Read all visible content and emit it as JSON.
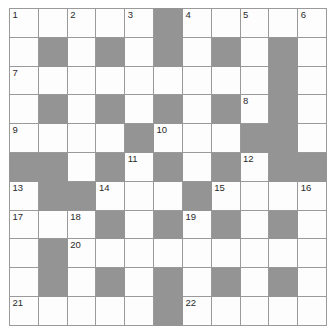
{
  "puzzle": {
    "title": "Crossword Grid",
    "rows": 11,
    "columns": 10,
    "colors": {
      "blocked_cell": "#949494",
      "open_cell": "#fdfdfd",
      "grid_line": "#9a9a9a",
      "number_text": "#2a2a2a"
    },
    "grid": [
      [
        {
          "blocked": false,
          "number": "1"
        },
        {
          "blocked": false,
          "number": ""
        },
        {
          "blocked": false,
          "number": "2"
        },
        {
          "blocked": false,
          "number": ""
        },
        {
          "blocked": false,
          "number": "3"
        },
        {
          "blocked": true,
          "number": ""
        },
        {
          "blocked": false,
          "number": "4"
        },
        {
          "blocked": false,
          "number": ""
        },
        {
          "blocked": false,
          "number": "5"
        },
        {
          "blocked": false,
          "number": ""
        },
        {
          "blocked": false,
          "number": "6"
        }
      ],
      [
        {
          "blocked": false,
          "number": ""
        },
        {
          "blocked": true,
          "number": ""
        },
        {
          "blocked": false,
          "number": ""
        },
        {
          "blocked": true,
          "number": ""
        },
        {
          "blocked": false,
          "number": ""
        },
        {
          "blocked": true,
          "number": ""
        },
        {
          "blocked": false,
          "number": ""
        },
        {
          "blocked": true,
          "number": ""
        },
        {
          "blocked": false,
          "number": ""
        },
        {
          "blocked": true,
          "number": ""
        },
        {
          "blocked": false,
          "number": ""
        }
      ],
      [
        {
          "blocked": false,
          "number": "7"
        },
        {
          "blocked": false,
          "number": ""
        },
        {
          "blocked": false,
          "number": ""
        },
        {
          "blocked": false,
          "number": ""
        },
        {
          "blocked": false,
          "number": ""
        },
        {
          "blocked": false,
          "number": ""
        },
        {
          "blocked": false,
          "number": ""
        },
        {
          "blocked": false,
          "number": ""
        },
        {
          "blocked": false,
          "number": ""
        },
        {
          "blocked": true,
          "number": ""
        },
        {
          "blocked": false,
          "number": ""
        }
      ],
      [
        {
          "blocked": false,
          "number": ""
        },
        {
          "blocked": true,
          "number": ""
        },
        {
          "blocked": false,
          "number": ""
        },
        {
          "blocked": true,
          "number": ""
        },
        {
          "blocked": false,
          "number": ""
        },
        {
          "blocked": true,
          "number": ""
        },
        {
          "blocked": false,
          "number": ""
        },
        {
          "blocked": true,
          "number": ""
        },
        {
          "blocked": false,
          "number": "8"
        },
        {
          "blocked": true,
          "number": ""
        },
        {
          "blocked": false,
          "number": ""
        }
      ],
      [
        {
          "blocked": false,
          "number": "9"
        },
        {
          "blocked": false,
          "number": ""
        },
        {
          "blocked": false,
          "number": ""
        },
        {
          "blocked": false,
          "number": ""
        },
        {
          "blocked": true,
          "number": ""
        },
        {
          "blocked": false,
          "number": "10"
        },
        {
          "blocked": false,
          "number": ""
        },
        {
          "blocked": false,
          "number": ""
        },
        {
          "blocked": true,
          "number": ""
        },
        {
          "blocked": true,
          "number": ""
        },
        {
          "blocked": false,
          "number": ""
        }
      ],
      [
        {
          "blocked": true,
          "number": ""
        },
        {
          "blocked": true,
          "number": ""
        },
        {
          "blocked": false,
          "number": ""
        },
        {
          "blocked": true,
          "number": ""
        },
        {
          "blocked": false,
          "number": "11"
        },
        {
          "blocked": true,
          "number": ""
        },
        {
          "blocked": false,
          "number": ""
        },
        {
          "blocked": true,
          "number": ""
        },
        {
          "blocked": false,
          "number": "12"
        },
        {
          "blocked": true,
          "number": ""
        },
        {
          "blocked": true,
          "number": ""
        }
      ],
      [
        {
          "blocked": false,
          "number": "13"
        },
        {
          "blocked": true,
          "number": ""
        },
        {
          "blocked": true,
          "number": ""
        },
        {
          "blocked": false,
          "number": "14"
        },
        {
          "blocked": false,
          "number": ""
        },
        {
          "blocked": false,
          "number": ""
        },
        {
          "blocked": true,
          "number": ""
        },
        {
          "blocked": false,
          "number": "15"
        },
        {
          "blocked": false,
          "number": ""
        },
        {
          "blocked": false,
          "number": ""
        },
        {
          "blocked": false,
          "number": "16"
        }
      ],
      [
        {
          "blocked": false,
          "number": "17"
        },
        {
          "blocked": false,
          "number": ""
        },
        {
          "blocked": false,
          "number": "18"
        },
        {
          "blocked": true,
          "number": ""
        },
        {
          "blocked": false,
          "number": ""
        },
        {
          "blocked": true,
          "number": ""
        },
        {
          "blocked": false,
          "number": "19"
        },
        {
          "blocked": true,
          "number": ""
        },
        {
          "blocked": false,
          "number": ""
        },
        {
          "blocked": true,
          "number": ""
        },
        {
          "blocked": false,
          "number": ""
        }
      ],
      [
        {
          "blocked": false,
          "number": ""
        },
        {
          "blocked": true,
          "number": ""
        },
        {
          "blocked": false,
          "number": "20"
        },
        {
          "blocked": false,
          "number": ""
        },
        {
          "blocked": false,
          "number": ""
        },
        {
          "blocked": false,
          "number": ""
        },
        {
          "blocked": false,
          "number": ""
        },
        {
          "blocked": false,
          "number": ""
        },
        {
          "blocked": false,
          "number": ""
        },
        {
          "blocked": false,
          "number": ""
        },
        {
          "blocked": false,
          "number": ""
        }
      ],
      [
        {
          "blocked": false,
          "number": ""
        },
        {
          "blocked": true,
          "number": ""
        },
        {
          "blocked": false,
          "number": ""
        },
        {
          "blocked": true,
          "number": ""
        },
        {
          "blocked": false,
          "number": ""
        },
        {
          "blocked": true,
          "number": ""
        },
        {
          "blocked": false,
          "number": ""
        },
        {
          "blocked": true,
          "number": ""
        },
        {
          "blocked": false,
          "number": ""
        },
        {
          "blocked": true,
          "number": ""
        },
        {
          "blocked": false,
          "number": ""
        }
      ],
      [
        {
          "blocked": false,
          "number": "21"
        },
        {
          "blocked": false,
          "number": ""
        },
        {
          "blocked": false,
          "number": ""
        },
        {
          "blocked": false,
          "number": ""
        },
        {
          "blocked": false,
          "number": ""
        },
        {
          "blocked": true,
          "number": ""
        },
        {
          "blocked": false,
          "number": "22"
        },
        {
          "blocked": false,
          "number": ""
        },
        {
          "blocked": false,
          "number": ""
        },
        {
          "blocked": false,
          "number": ""
        },
        {
          "blocked": false,
          "number": ""
        }
      ]
    ]
  }
}
